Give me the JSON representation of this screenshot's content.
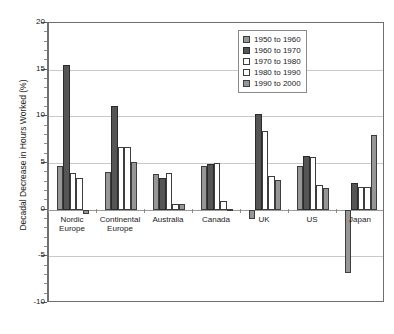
{
  "chart_data": {
    "type": "bar",
    "title": "",
    "xlabel": "",
    "ylabel": "Decadal Decrease in Hours Worked (%)",
    "ylim": [
      -10,
      20
    ],
    "ytick_values": [
      20,
      15,
      10,
      5,
      0,
      -5,
      -10
    ],
    "ytick_labels": [
      "20",
      "15",
      "10",
      "5",
      "0",
      "-5",
      "-10"
    ],
    "grid": true,
    "legend_position": "top-right",
    "categories": [
      "Nordic\nEurope",
      "Continental\nEurope",
      "Australia",
      "Canada",
      "UK",
      "US",
      "Japan"
    ],
    "category_names": [
      "Nordic Europe",
      "Continental Europe",
      "Australia",
      "Canada",
      "UK",
      "US",
      "Japan"
    ],
    "series": [
      {
        "name": "1950 to 1960",
        "color": "#969696",
        "values": [
          4.7,
          4.0,
          3.8,
          4.7,
          -1.0,
          4.7,
          -6.8
        ]
      },
      {
        "name": "1960 to 1970",
        "color": "#555555",
        "values": [
          15.5,
          11.1,
          3.4,
          4.9,
          10.2,
          5.8,
          2.9
        ]
      },
      {
        "name": "1970 to 1980",
        "color": "#ffffff",
        "values": [
          3.9,
          6.7,
          3.9,
          5.0,
          8.4,
          5.6,
          2.4
        ]
      },
      {
        "name": "1980 to 1990",
        "color": "#ffffff",
        "values": [
          3.4,
          6.7,
          0.6,
          0.9,
          3.6,
          2.6,
          2.4
        ]
      },
      {
        "name": "1990 to 2000",
        "color": "#969696",
        "values": [
          -0.5,
          5.1,
          0.6,
          0.1,
          3.2,
          2.3,
          8.0
        ]
      }
    ]
  },
  "legend": {
    "items": [
      {
        "label": "1950 to 1960",
        "swatch": "medium-gray"
      },
      {
        "label": "1960 to 1970",
        "swatch": "dark-gray"
      },
      {
        "label": "1970 to 1980",
        "swatch": "white"
      },
      {
        "label": "1980 to 1990",
        "swatch": "white"
      },
      {
        "label": "1990 to 2000",
        "swatch": "medium-gray"
      }
    ]
  }
}
